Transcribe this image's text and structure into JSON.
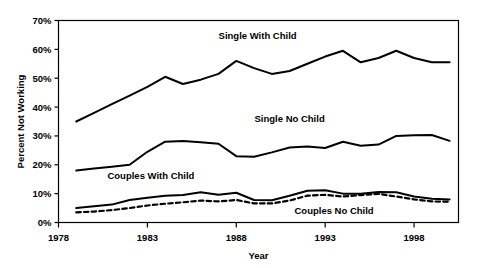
{
  "chart_data": {
    "type": "line",
    "title": "",
    "xlabel": "Year",
    "ylabel": "Percent Not Working",
    "xlim": [
      1978,
      2000.5
    ],
    "ylim": [
      0,
      70
    ],
    "grid": false,
    "legend_position": "inline-annotations",
    "x_tick_labels": [
      "1978",
      "1983",
      "1988",
      "1993",
      "1998"
    ],
    "x_ticks": [
      1978,
      1983,
      1988,
      1993,
      1998
    ],
    "y_tick_labels": [
      "0%",
      "10%",
      "20%",
      "30%",
      "40%",
      "50%",
      "60%",
      "70%"
    ],
    "y_ticks": [
      0,
      10,
      20,
      30,
      40,
      50,
      60,
      70
    ],
    "x": [
      1979,
      1980,
      1981,
      1982,
      1983,
      1984,
      1985,
      1986,
      1987,
      1988,
      1989,
      1990,
      1991,
      1992,
      1993,
      1994,
      1995,
      1996,
      1997,
      1998,
      1999,
      2000
    ],
    "series": [
      {
        "name": "Single With Child",
        "style": "solid",
        "color": "#000000",
        "label_x": 1989.2,
        "label_y": 63.5,
        "values": [
          35.0,
          38.0,
          41.0,
          44.0,
          47.0,
          50.5,
          48.0,
          49.5,
          51.5,
          56.0,
          53.5,
          51.5,
          52.5,
          55.0,
          57.5,
          59.5,
          55.5,
          57.0,
          59.5,
          57.0,
          55.5,
          55.5
        ]
      },
      {
        "name": "Single No Child",
        "style": "solid",
        "color": "#000000",
        "label_x": 1991.0,
        "label_y": 35.0,
        "values": [
          18.0,
          18.7,
          19.3,
          20.0,
          24.5,
          28.0,
          28.2,
          27.8,
          27.3,
          23.0,
          22.8,
          24.3,
          26.0,
          26.3,
          25.8,
          28.0,
          26.6,
          27.0,
          30.0,
          30.2,
          30.3,
          28.3
        ]
      },
      {
        "name": "Couples With Child",
        "style": "solid",
        "color": "#000000",
        "label_x": 1983.2,
        "label_y": 15.0,
        "values": [
          5.0,
          5.6,
          6.2,
          7.8,
          8.6,
          9.3,
          9.5,
          10.5,
          9.6,
          10.3,
          7.8,
          7.7,
          9.3,
          11.0,
          11.2,
          10.0,
          10.0,
          10.6,
          10.5,
          9.0,
          8.2,
          8.0
        ]
      },
      {
        "name": "Couples No Child",
        "style": "dashed",
        "color": "#000000",
        "label_x": 1993.5,
        "label_y": 3.0,
        "values": [
          3.5,
          3.8,
          4.3,
          5.0,
          5.9,
          6.5,
          7.0,
          7.6,
          7.3,
          7.8,
          6.6,
          6.6,
          7.6,
          9.3,
          9.6,
          9.0,
          9.5,
          9.9,
          9.0,
          8.0,
          7.3,
          7.2
        ]
      }
    ]
  }
}
